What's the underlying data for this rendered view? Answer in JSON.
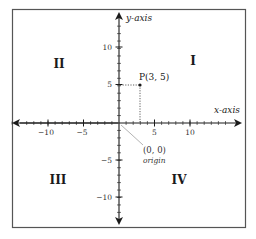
{
  "diagram": {
    "axes": {
      "x_label": "x-axis",
      "y_label": "y-axis",
      "x_ticks": [
        {
          "value": -10,
          "label": "−10"
        },
        {
          "value": -5,
          "label": "−5"
        },
        {
          "value": 5,
          "label": "5"
        },
        {
          "value": 10,
          "label": "10"
        }
      ],
      "y_ticks": [
        {
          "value": 10,
          "label": "10"
        },
        {
          "value": 5,
          "label": "5"
        },
        {
          "value": -5,
          "label": "−5"
        },
        {
          "value": -10,
          "label": "−10"
        }
      ]
    },
    "quadrants": {
      "q1": "I",
      "q2": "II",
      "q3": "III",
      "q4": "IV"
    },
    "point": {
      "label": "P(3, 5)",
      "x": 3,
      "y": 5
    },
    "origin": {
      "coords": "(0, 0)",
      "label": "origin"
    },
    "colors": {
      "ink": "#1a1a1a",
      "muted": "#444444",
      "pointer": "#aaaaaa",
      "border": "#555555",
      "background": "#ffffff"
    }
  }
}
